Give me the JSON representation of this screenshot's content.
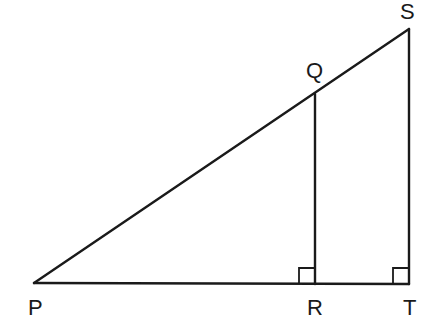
{
  "diagram": {
    "type": "geometry-figure",
    "stroke_color": "#1a1a1a",
    "background": "#ffffff",
    "points": {
      "P": {
        "label": "P",
        "x": 34,
        "y": 283
      },
      "Q": {
        "label": "Q",
        "x": 315,
        "y": 94
      },
      "R": {
        "label": "R",
        "x": 315,
        "y": 284
      },
      "S": {
        "label": "S",
        "x": 409,
        "y": 29
      },
      "T": {
        "label": "T",
        "x": 409,
        "y": 284
      }
    },
    "segments": [
      {
        "from": "P",
        "to": "S"
      },
      {
        "from": "P",
        "to": "T"
      },
      {
        "from": "Q",
        "to": "R"
      },
      {
        "from": "S",
        "to": "T"
      }
    ],
    "right_angles": [
      {
        "vertex": "R",
        "label": "angle-QRP"
      },
      {
        "vertex": "T",
        "label": "angle-STP"
      }
    ],
    "labels": {
      "P": "P",
      "Q": "Q",
      "R": "R",
      "S": "S",
      "T": "T"
    }
  }
}
